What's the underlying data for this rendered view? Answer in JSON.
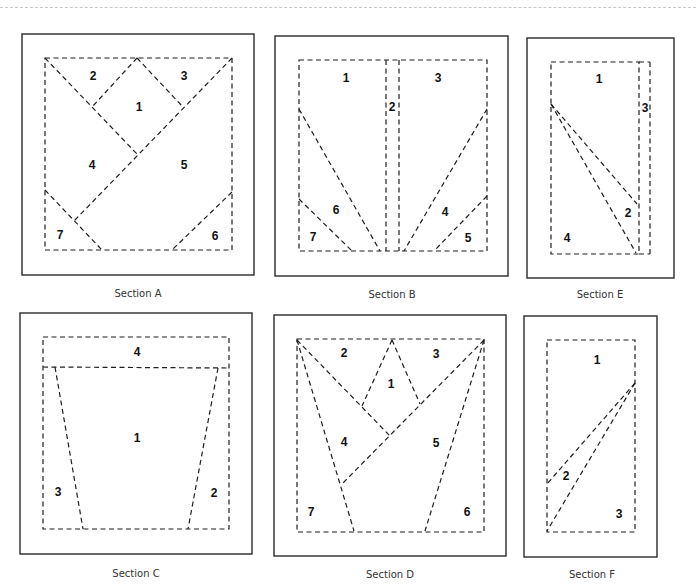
{
  "sections": [
    {
      "id": "A",
      "caption": "Section A",
      "frame": [
        22,
        34,
        232,
        241
      ],
      "inner": [
        45,
        58,
        187,
        192
      ],
      "lines": [
        [
          45,
          58,
          137,
          154
        ],
        [
          137,
          58,
          92,
          107
        ],
        [
          137,
          58,
          183,
          107
        ],
        [
          232,
          58,
          74,
          221
        ],
        [
          45,
          190,
          102,
          250
        ],
        [
          232,
          192,
          172,
          250
        ]
      ],
      "pieces": [
        {
          "label": "1",
          "x": 139,
          "y": 108
        },
        {
          "label": "2",
          "x": 93,
          "y": 77
        },
        {
          "label": "3",
          "x": 184,
          "y": 77
        },
        {
          "label": "4",
          "x": 92,
          "y": 166
        },
        {
          "label": "5",
          "x": 184,
          "y": 166
        },
        {
          "label": "6",
          "x": 215,
          "y": 237
        },
        {
          "label": "7",
          "x": 60,
          "y": 236
        }
      ]
    },
    {
      "id": "B",
      "caption": "Section B",
      "frame": [
        275,
        36,
        233,
        240
      ],
      "inner": [
        299,
        60,
        188,
        191
      ],
      "lines": [
        [
          386,
          60,
          386,
          251
        ],
        [
          399,
          60,
          399,
          251
        ],
        [
          299,
          109,
          380,
          251
        ],
        [
          299,
          199,
          352,
          251
        ],
        [
          487,
          109,
          404,
          251
        ],
        [
          487,
          196,
          434,
          251
        ]
      ],
      "pieces": [
        {
          "label": "1",
          "x": 346,
          "y": 79
        },
        {
          "label": "2",
          "x": 392,
          "y": 108
        },
        {
          "label": "3",
          "x": 438,
          "y": 79
        },
        {
          "label": "4",
          "x": 445,
          "y": 213
        },
        {
          "label": "5",
          "x": 468,
          "y": 239
        },
        {
          "label": "6",
          "x": 336,
          "y": 211
        },
        {
          "label": "7",
          "x": 313,
          "y": 238
        }
      ]
    },
    {
      "id": "E",
      "caption": "Section E",
      "frame": [
        527,
        38,
        147,
        240
      ],
      "inner": [
        551,
        62,
        88,
        192
      ],
      "lines": [
        [
          639,
          62,
          650,
          62
        ],
        [
          650,
          62,
          650,
          254
        ],
        [
          639,
          254,
          650,
          254
        ],
        [
          551,
          104,
          637,
          204
        ],
        [
          551,
          104,
          636,
          253
        ]
      ],
      "pieces": [
        {
          "label": "1",
          "x": 599,
          "y": 80
        },
        {
          "label": "2",
          "x": 628,
          "y": 214
        },
        {
          "label": "3",
          "x": 645,
          "y": 109
        },
        {
          "label": "4",
          "x": 567,
          "y": 239
        }
      ]
    },
    {
      "id": "C",
      "caption": "Section C",
      "frame": [
        20,
        313,
        232,
        241
      ],
      "inner": [
        43,
        337,
        186,
        192
      ],
      "lines": [
        [
          43,
          367,
          229,
          368
        ],
        [
          55,
          367,
          83,
          529
        ],
        [
          218,
          368,
          188,
          529
        ]
      ],
      "pieces": [
        {
          "label": "1",
          "x": 137,
          "y": 439
        },
        {
          "label": "2",
          "x": 214,
          "y": 494
        },
        {
          "label": "3",
          "x": 58,
          "y": 493
        },
        {
          "label": "4",
          "x": 137,
          "y": 353
        }
      ]
    },
    {
      "id": "D",
      "caption": "Section D",
      "frame": [
        274,
        315,
        232,
        241
      ],
      "inner": [
        297,
        339,
        187,
        193
      ],
      "lines": [
        [
          297,
          340,
          390,
          436
        ],
        [
          392,
          340,
          362,
          406
        ],
        [
          392,
          340,
          420,
          404
        ],
        [
          484,
          340,
          342,
          484
        ],
        [
          297,
          340,
          354,
          531
        ],
        [
          484,
          340,
          425,
          531
        ]
      ],
      "pieces": [
        {
          "label": "1",
          "x": 391,
          "y": 385
        },
        {
          "label": "2",
          "x": 344,
          "y": 354
        },
        {
          "label": "3",
          "x": 436,
          "y": 355
        },
        {
          "label": "4",
          "x": 344,
          "y": 443
        },
        {
          "label": "5",
          "x": 436,
          "y": 444
        },
        {
          "label": "6",
          "x": 467,
          "y": 513
        },
        {
          "label": "7",
          "x": 311,
          "y": 513
        }
      ]
    },
    {
      "id": "F",
      "caption": "Section F",
      "frame": [
        524,
        316,
        133,
        241
      ],
      "inner": [
        547,
        340,
        88,
        192
      ],
      "lines": [
        [
          635,
          383,
          547,
          484
        ],
        [
          635,
          383,
          547,
          531
        ]
      ],
      "pieces": [
        {
          "label": "1",
          "x": 597,
          "y": 361
        },
        {
          "label": "2",
          "x": 566,
          "y": 477
        },
        {
          "label": "3",
          "x": 619,
          "y": 515
        }
      ]
    }
  ],
  "caption_positions": {
    "A": {
      "x": 138,
      "y": 297
    },
    "B": {
      "x": 392,
      "y": 298
    },
    "E": {
      "x": 600,
      "y": 298
    },
    "C": {
      "x": 136,
      "y": 577
    },
    "D": {
      "x": 390,
      "y": 578
    },
    "F": {
      "x": 592,
      "y": 578
    }
  }
}
